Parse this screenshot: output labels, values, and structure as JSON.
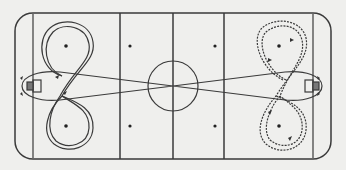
{
  "diagram": {
    "type": "hockey-rink-drill",
    "background": "#efefed",
    "ink_color": "#3a3a3a",
    "rink": {
      "x": 15,
      "y": 13,
      "width": 316,
      "height": 146,
      "corner_radius": 18
    },
    "goal_lines_x": [
      33,
      313
    ],
    "blue_lines_x": [
      120,
      224
    ],
    "center_line_x": 173,
    "center_circle": {
      "cx": 173,
      "cy": 86,
      "r": 25
    },
    "faceoff_circles_left": [
      {
        "cx": 66,
        "cy": 46
      },
      {
        "cx": 66,
        "cy": 126
      }
    ],
    "faceoff_dots": [
      {
        "cx": 66,
        "cy": 46
      },
      {
        "cx": 66,
        "cy": 126
      },
      {
        "cx": 130,
        "cy": 46
      },
      {
        "cx": 130,
        "cy": 126
      },
      {
        "cx": 215,
        "cy": 46
      },
      {
        "cx": 215,
        "cy": 126
      },
      {
        "cx": 279,
        "cy": 46
      },
      {
        "cx": 279,
        "cy": 126
      }
    ],
    "paths": [
      {
        "name": "left-figure-eight-skate",
        "style": "double-line"
      },
      {
        "name": "right-figure-eight-stickhandle",
        "style": "wavy"
      },
      {
        "name": "crossing-lanes",
        "style": "solid"
      }
    ]
  }
}
